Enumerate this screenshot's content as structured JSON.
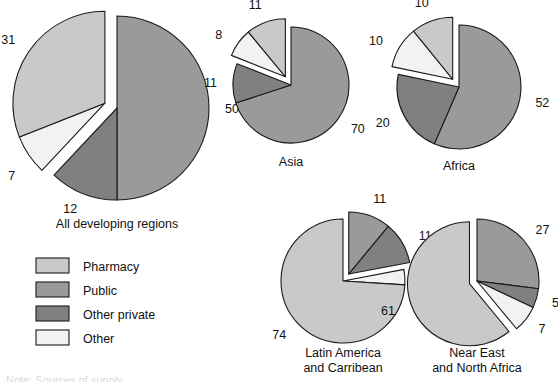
{
  "figure": {
    "title": "",
    "background_color": "#ffffff",
    "cropped_caption_fragment": "Note: Sources of supply"
  },
  "legend": {
    "position": "lower-left",
    "items": [
      {
        "label": "Pharmacy",
        "key": "pharmacy",
        "color": "#c9c9c9"
      },
      {
        "label": "Public",
        "key": "public",
        "color": "#9a9a9a"
      },
      {
        "label": "Other private",
        "key": "other_private",
        "color": "#808080"
      },
      {
        "label": "Other",
        "key": "other",
        "color": "#f2f2f2"
      }
    ]
  },
  "chart_data": {
    "type": "pie",
    "title": "",
    "units": "percent",
    "categories": [
      "Public",
      "Other private",
      "Other",
      "Pharmacy"
    ],
    "colors": {
      "Pharmacy": "#c9c9c9",
      "Public": "#9a9a9a",
      "Other private": "#808080",
      "Other": "#f2f2f2"
    },
    "charts": [
      {
        "name": "All developing regions",
        "title": "All developing regions",
        "title_lines": [
          "All developing regions"
        ],
        "slices": [
          {
            "label": "Public",
            "value": 50,
            "display": "50",
            "exploded": false
          },
          {
            "label": "Other private",
            "value": 12,
            "display": "12",
            "exploded": false
          },
          {
            "label": "Other",
            "value": 7,
            "display": "7",
            "exploded": true
          },
          {
            "label": "Pharmacy",
            "value": 31,
            "display": "31",
            "exploded": true
          }
        ]
      },
      {
        "name": "Asia",
        "title": "Asia",
        "title_lines": [
          "Asia"
        ],
        "slices": [
          {
            "label": "Public",
            "value": 70,
            "display": "70",
            "exploded": false
          },
          {
            "label": "Other private",
            "value": 11,
            "display": "11",
            "exploded": false
          },
          {
            "label": "Other",
            "value": 8,
            "display": "8",
            "exploded": true
          },
          {
            "label": "Pharmacy",
            "value": 11,
            "display": "11",
            "exploded": true
          }
        ]
      },
      {
        "name": "Africa",
        "title": "Africa",
        "title_lines": [
          "Africa"
        ],
        "slices": [
          {
            "label": "Public",
            "value": 52,
            "display": "52",
            "exploded": false
          },
          {
            "label": "Other private",
            "value": 20,
            "display": "20",
            "exploded": false
          },
          {
            "label": "Other",
            "value": 10,
            "display": "10",
            "exploded": true
          },
          {
            "label": "Pharmacy",
            "value": 10,
            "display": "10",
            "exploded": true
          }
        ]
      },
      {
        "name": "Latin America and Carribean",
        "title": "Latin America and Carribean",
        "title_lines": [
          "Latin America",
          "and Carribean"
        ],
        "slices": [
          {
            "label": "Public",
            "value": 11,
            "display": "11",
            "exploded": true
          },
          {
            "label": "Other private",
            "value": 11,
            "display": "11",
            "exploded": true
          },
          {
            "label": "Other",
            "value": 4,
            "display": "4",
            "exploded": false
          },
          {
            "label": "Pharmacy",
            "value": 74,
            "display": "74",
            "exploded": false
          }
        ]
      },
      {
        "name": "Near East and North Africa",
        "title": "Near East and North Africa",
        "title_lines": [
          "Near East",
          "and North Africa"
        ],
        "slices": [
          {
            "label": "Public",
            "value": 27,
            "display": "27",
            "exploded": false
          },
          {
            "label": "Other private",
            "value": 5,
            "display": "5",
            "exploded": false
          },
          {
            "label": "Other",
            "value": 7,
            "display": "7",
            "exploded": false
          },
          {
            "label": "Pharmacy",
            "value": 61,
            "display": "61",
            "exploded": true
          }
        ]
      }
    ]
  },
  "layout": {
    "charts": [
      {
        "name": "All developing regions",
        "cx": 117,
        "cy": 108,
        "r": 92,
        "title_x": 117,
        "title_y": 228,
        "explode": 13
      },
      {
        "name": "Asia",
        "cx": 291,
        "cy": 85,
        "r": 58,
        "title_x": 291,
        "title_y": 166,
        "explode": 10
      },
      {
        "name": "Africa",
        "cx": 459,
        "cy": 87,
        "r": 62,
        "title_x": 459,
        "title_y": 170,
        "explode": 10
      },
      {
        "name": "Latin America and Carribean",
        "cx": 343,
        "cy": 281,
        "r": 62,
        "title_x": 343,
        "title_y": 357,
        "explode": 9
      },
      {
        "name": "Near East and North Africa",
        "cx": 477,
        "cy": 281,
        "r": 62,
        "title_x": 477,
        "title_y": 357,
        "explode": 8
      }
    ],
    "legend": {
      "x": 36,
      "y": 258,
      "swatch_w": 33,
      "swatch_h": 15,
      "row_h": 24,
      "label_dx": 47
    }
  }
}
